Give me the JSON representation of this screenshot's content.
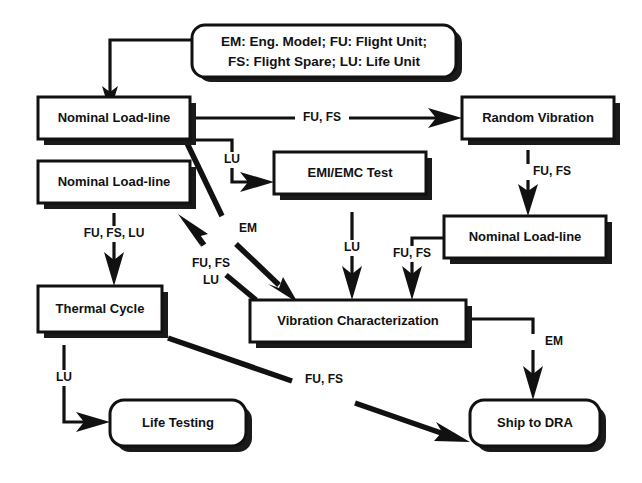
{
  "diagram": {
    "type": "flowchart",
    "background_color": "#ffffff",
    "line_color": "#111111",
    "box_fill_color": "#ffffff"
  },
  "legend": {
    "line1": "EM: Eng. Model;  FU: Flight Unit;",
    "line2": "FS: Flight Spare;  LU: Life Unit",
    "abbreviations": [
      {
        "code": "EM",
        "meaning": "Eng. Model"
      },
      {
        "code": "FU",
        "meaning": "Flight Unit"
      },
      {
        "code": "FS",
        "meaning": "Flight Spare"
      },
      {
        "code": "LU",
        "meaning": "Life Unit"
      }
    ]
  },
  "nodes": [
    {
      "id": "nominal1",
      "label": "Nominal Load-line",
      "shape": "rect"
    },
    {
      "id": "nominal2",
      "label": "Nominal Load-line",
      "shape": "rect"
    },
    {
      "id": "random_vibration",
      "label": "Random Vibration",
      "shape": "rect"
    },
    {
      "id": "emi_emc",
      "label": "EMI/EMC Test",
      "shape": "rect"
    },
    {
      "id": "nominal3",
      "label": "Nominal Load-line",
      "shape": "rect"
    },
    {
      "id": "thermal_cycle",
      "label": "Thermal Cycle",
      "shape": "rect"
    },
    {
      "id": "vibration_char",
      "label": "Vibration Characterization",
      "shape": "rect"
    },
    {
      "id": "life_testing",
      "label": "Life Testing",
      "shape": "rounded"
    },
    {
      "id": "ship_dra",
      "label": "Ship to DRA",
      "shape": "rounded"
    }
  ],
  "edges": [
    {
      "id": "e-legend-nominal1",
      "from": "legend",
      "to": "nominal1",
      "label": ""
    },
    {
      "id": "e-nominal1-random",
      "from": "nominal1",
      "to": "random_vibration",
      "label": "FU, FS"
    },
    {
      "id": "e-nominal1-emi",
      "from": "nominal1",
      "to": "emi_emc",
      "label": "LU"
    },
    {
      "id": "e-nominal1-vibchar",
      "from": "nominal1",
      "to": "vibration_char",
      "label": "EM"
    },
    {
      "id": "e-random-nominal3",
      "from": "random_vibration",
      "to": "nominal3",
      "label": "FU, FS"
    },
    {
      "id": "e-emi-vibchar",
      "from": "emi_emc",
      "to": "vibration_char",
      "label": "LU"
    },
    {
      "id": "e-nominal3-vibchar",
      "from": "nominal3",
      "to": "vibration_char",
      "label": "FU, FS"
    },
    {
      "id": "e-nominal2-thermal",
      "from": "nominal2",
      "to": "thermal_cycle",
      "label": "FU, FS, LU"
    },
    {
      "id": "e-vibchar-nominal2",
      "from": "vibration_char",
      "to": "nominal2",
      "label": "FU, FS LU"
    },
    {
      "id": "e-thermal-life",
      "from": "thermal_cycle",
      "to": "life_testing",
      "label": "LU"
    },
    {
      "id": "e-thermal-ship",
      "from": "thermal_cycle",
      "to": "ship_dra",
      "label": "FU, FS"
    },
    {
      "id": "e-vibchar-ship",
      "from": "vibration_char",
      "to": "ship_dra",
      "label": "EM"
    }
  ],
  "edge_labels": {
    "nominal1_random": "FU, FS",
    "nominal1_emi": "LU",
    "nominal1_vibchar": "EM",
    "random_nominal3": "FU, FS",
    "emi_vibchar": "LU",
    "nominal3_vibchar": "FU, FS",
    "nominal2_thermal": "FU, FS, LU",
    "vibchar_nominal2_line1": "FU, FS",
    "vibchar_nominal2_line2": "LU",
    "thermal_life": "LU",
    "thermal_ship": "FU, FS",
    "vibchar_ship": "EM"
  }
}
